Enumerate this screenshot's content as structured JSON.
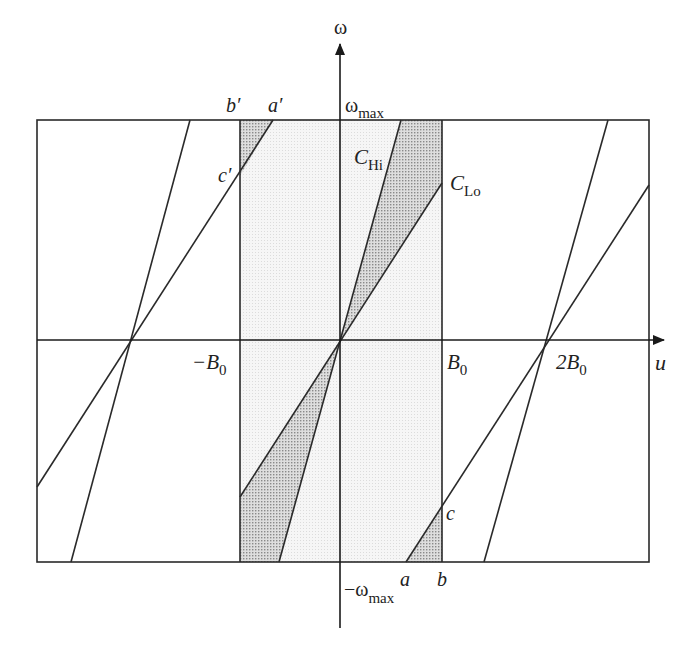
{
  "axes": {
    "vertical_label": "ω",
    "horizontal_label": "u",
    "omega_max_label": "ω",
    "omega_max_sub": "max",
    "neg_omega_max_label": "−ω",
    "neg_omega_max_sub": "max"
  },
  "ticks": {
    "neg_b0": "−B",
    "neg_b0_sub": "0",
    "b0": "B",
    "b0_sub": "0",
    "two_b0": "2B",
    "two_b0_sub": "0"
  },
  "curves": {
    "c_hi": "C",
    "c_hi_sub": "Hi",
    "c_lo": "C",
    "c_lo_sub": "Lo"
  },
  "points": {
    "a": "a",
    "b": "b",
    "c": "c",
    "a_prime": "a′",
    "b_prime": "b′",
    "c_prime": "c′"
  },
  "colors": {
    "line": "#2a2a2a",
    "light_fill": "#f1f1f1",
    "dark_fill": "#cfcfcf"
  }
}
